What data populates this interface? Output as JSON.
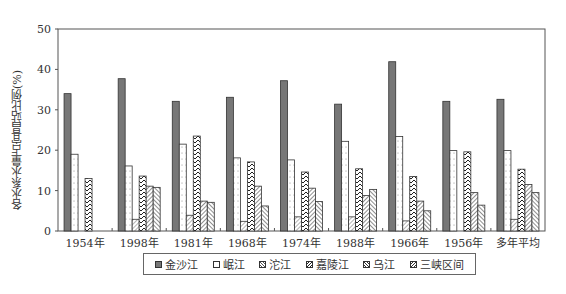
{
  "chart_data": {
    "type": "bar",
    "title": "",
    "xlabel": "",
    "ylabel": "各水系水量占宜昌站比例(%)",
    "ylim": [
      0,
      50
    ],
    "yticks": [
      0,
      10,
      20,
      30,
      40,
      50
    ],
    "grid": false,
    "legend_position": "bottom",
    "categories": [
      "1954年",
      "1998年",
      "1981年",
      "1968年",
      "1974年",
      "1988年",
      "1966年",
      "1956年",
      "多年平均"
    ],
    "series": [
      {
        "name": "金沙江",
        "pattern": "solid-gray",
        "values": [
          34.0,
          37.7,
          32.1,
          33.1,
          37.2,
          31.4,
          41.9,
          32.1,
          32.6
        ]
      },
      {
        "name": "岷江",
        "pattern": "dotted-white",
        "values": [
          19.0,
          16.1,
          21.5,
          18.1,
          17.6,
          22.2,
          23.4,
          19.9,
          19.9
        ]
      },
      {
        "name": "沱江",
        "pattern": "diagonal-fine",
        "values": [
          0,
          2.9,
          3.9,
          2.4,
          3.5,
          3.5,
          2.5,
          0,
          2.9
        ]
      },
      {
        "name": "嘉陵江",
        "pattern": "zigzag",
        "values": [
          13.0,
          13.6,
          23.5,
          17.1,
          14.6,
          15.4,
          13.5,
          19.6,
          15.3
        ]
      },
      {
        "name": "乌江",
        "pattern": "diagonal-right",
        "values": [
          0,
          11.1,
          7.4,
          11.1,
          10.6,
          8.8,
          7.4,
          9.5,
          11.5
        ]
      },
      {
        "name": "三峡区间",
        "pattern": "diagonal-left",
        "values": [
          0,
          10.8,
          7.1,
          6.2,
          7.3,
          10.3,
          5.0,
          6.4,
          9.5
        ]
      }
    ]
  },
  "legend": {
    "items": [
      "金沙江",
      "岷江",
      "沱江",
      "嘉陵江",
      "乌江",
      "三峡区间"
    ]
  },
  "colors": {
    "jinsha_fill": "#777777",
    "outline": "#333333",
    "axis": "#555555"
  }
}
